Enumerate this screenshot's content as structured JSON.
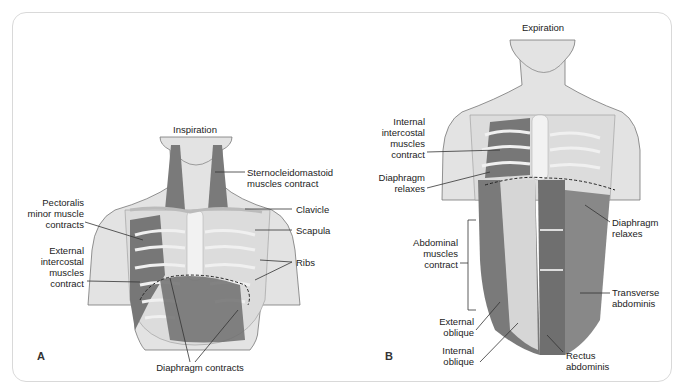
{
  "figure": {
    "panels": [
      {
        "letter": "A",
        "title": "Inspiration",
        "labels": {
          "scm": "Sternocleidomastoid muscles contract",
          "scm_line1": "Sternocleidomastoid",
          "scm_line2": "muscles contract",
          "pec1": "Pectoralis",
          "pec2": "minor muscle",
          "pec3": "contracts",
          "ext1": "External",
          "ext2": "intercostal",
          "ext3": "muscles",
          "ext4": "contract",
          "clavicle": "Clavicle",
          "scapula": "Scapula",
          "ribs": "Ribs",
          "diaphragm": "Diaphragm contracts"
        }
      },
      {
        "letter": "B",
        "title": "Expiration",
        "labels": {
          "int1": "Internal",
          "int2": "intercostal",
          "int3": "muscles",
          "int4": "contract",
          "dia1": "Diaphragm",
          "dia2": "relaxes",
          "diar1": "Diaphragm",
          "diar2": "relaxes",
          "abd1": "Abdominal",
          "abd2": "muscles",
          "abd3": "contract",
          "ext1": "External",
          "ext2": "oblique",
          "intob1": "Internal",
          "intob2": "oblique",
          "trans1": "Transverse",
          "trans2": "abdominis",
          "rect1": "Rectus",
          "rect2": "abdominis"
        }
      }
    ],
    "colors": {
      "skin": "#e2e2e2",
      "bone": "#ececec",
      "muscle": "#7b7b7b",
      "outline": "#8a8a8a"
    }
  }
}
